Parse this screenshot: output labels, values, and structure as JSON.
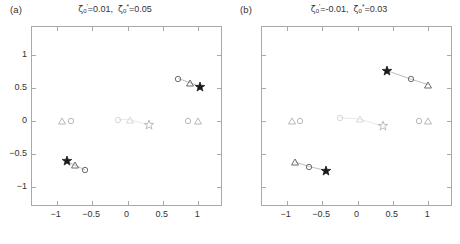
{
  "figure": {
    "background": "#ffffff",
    "axis_color": "#a9a9a9",
    "dark_marker_color": "#1a1a1a",
    "mid_marker_color": "#8a8a8a",
    "light_marker_color": "#cfcfcf",
    "faint_marker_color": "#e2e2e2"
  },
  "panels": [
    {
      "label": "(a)",
      "title_plain": "ζ'₀=0.01, ζ*₀=0.05",
      "title_parts": {
        "sym1": "ζ",
        "sub1": "0",
        "sup1": "'",
        "eq1": "=0.01,",
        "sym2": "ζ",
        "sub2": "0",
        "sup2": "*",
        "eq2": "=0.05"
      }
    },
    {
      "label": "(b)",
      "title_plain": "ζ'₀=-0.01, ζ*₀=0.03",
      "title_parts": {
        "sym1": "ζ",
        "sub1": "0",
        "sup1": "'",
        "eq1": "=-0.01,",
        "sym2": "ζ",
        "sub2": "0",
        "sup2": "*",
        "eq2": "=0.03"
      }
    }
  ],
  "axes": {
    "xlim": [
      -1.35,
      1.35
    ],
    "ylim": [
      -1.3,
      1.42
    ],
    "xticks": [
      -1,
      -0.5,
      0,
      0.5,
      1
    ],
    "xticklabels": [
      "−1",
      "−0.5",
      "0",
      "0.5",
      "1"
    ],
    "yticks": [
      1,
      0.5,
      0,
      -0.5,
      -1
    ],
    "yticklabels": [
      "1",
      "0.5",
      "0",
      "−0.5",
      "−1"
    ],
    "grid": false,
    "box": true
  },
  "chart_data": {
    "type": "scatter",
    "xlabel": "",
    "ylabel": "",
    "xlim": [
      -1.35,
      1.35
    ],
    "ylim": [
      -1.3,
      1.42
    ],
    "xticks": [
      -1,
      -0.5,
      0,
      0.5,
      1
    ],
    "yticks": [
      1,
      0.5,
      0,
      -0.5,
      -1
    ],
    "grid": false,
    "legend": "none",
    "marker_shapes": [
      "circle",
      "triangle",
      "star"
    ],
    "panels": [
      {
        "name": "(a)",
        "title": "ζ'₀=0.01, ζ*₀=0.05",
        "series": [
          {
            "name": "upper-right-branch",
            "shade": "dark",
            "connector": true,
            "points": [
              {
                "x": 0.72,
                "y": 0.64,
                "marker": "circle",
                "color": "#6d6d6d"
              },
              {
                "x": 0.88,
                "y": 0.58,
                "marker": "triangle",
                "color": "#6d6d6d"
              },
              {
                "x": 1.02,
                "y": 0.52,
                "marker": "star",
                "color": "#1a1a1a",
                "filled": true
              }
            ]
          },
          {
            "name": "lower-left-branch",
            "shade": "dark",
            "connector": true,
            "points": [
              {
                "x": -0.86,
                "y": -0.61,
                "marker": "star",
                "color": "#1a1a1a",
                "filled": true
              },
              {
                "x": -0.74,
                "y": -0.67,
                "marker": "triangle",
                "color": "#6d6d6d"
              },
              {
                "x": -0.6,
                "y": -0.74,
                "marker": "circle",
                "color": "#6d6d6d"
              }
            ]
          },
          {
            "name": "left-real-pair",
            "shade": "light",
            "connector": false,
            "points": [
              {
                "x": -0.92,
                "y": 0.0,
                "marker": "triangle",
                "color": "#b8b8b8"
              },
              {
                "x": -0.8,
                "y": 0.0,
                "marker": "circle",
                "color": "#b8b8b8"
              }
            ]
          },
          {
            "name": "right-real-pair",
            "shade": "light",
            "connector": false,
            "points": [
              {
                "x": 0.86,
                "y": 0.0,
                "marker": "circle",
                "color": "#b8b8b8"
              },
              {
                "x": 0.99,
                "y": 0.0,
                "marker": "triangle",
                "color": "#b8b8b8"
              }
            ]
          },
          {
            "name": "center-faint-branch",
            "shade": "faint",
            "connector": true,
            "points": [
              {
                "x": -0.13,
                "y": 0.02,
                "marker": "circle",
                "color": "#d8d8d8"
              },
              {
                "x": 0.03,
                "y": 0.02,
                "marker": "triangle",
                "color": "#d8d8d8"
              },
              {
                "x": 0.3,
                "y": -0.06,
                "marker": "star",
                "color": "#bdbdbd",
                "filled": false
              }
            ]
          }
        ]
      },
      {
        "name": "(b)",
        "title": "ζ'₀=-0.01, ζ*₀=0.03",
        "series": [
          {
            "name": "upper-right-branch",
            "shade": "dark",
            "connector": true,
            "points": [
              {
                "x": 0.42,
                "y": 0.76,
                "marker": "star",
                "color": "#1a1a1a",
                "filled": true
              },
              {
                "x": 0.76,
                "y": 0.63,
                "marker": "circle",
                "color": "#6d6d6d"
              },
              {
                "x": 1.0,
                "y": 0.55,
                "marker": "triangle",
                "color": "#6d6d6d"
              }
            ]
          },
          {
            "name": "lower-left-branch",
            "shade": "dark",
            "connector": true,
            "points": [
              {
                "x": -0.88,
                "y": -0.62,
                "marker": "triangle",
                "color": "#6d6d6d"
              },
              {
                "x": -0.68,
                "y": -0.69,
                "marker": "circle",
                "color": "#6d6d6d"
              },
              {
                "x": -0.44,
                "y": -0.75,
                "marker": "star",
                "color": "#1a1a1a",
                "filled": true
              }
            ]
          },
          {
            "name": "left-real-pair",
            "shade": "light",
            "connector": false,
            "points": [
              {
                "x": -0.93,
                "y": 0.0,
                "marker": "triangle",
                "color": "#b8b8b8"
              },
              {
                "x": -0.81,
                "y": 0.0,
                "marker": "circle",
                "color": "#b8b8b8"
              }
            ]
          },
          {
            "name": "right-real-pair",
            "shade": "light",
            "connector": false,
            "points": [
              {
                "x": 0.87,
                "y": 0.0,
                "marker": "circle",
                "color": "#b8b8b8"
              },
              {
                "x": 1.0,
                "y": 0.0,
                "marker": "triangle",
                "color": "#b8b8b8"
              }
            ]
          },
          {
            "name": "center-faint-branch",
            "shade": "faint",
            "connector": true,
            "points": [
              {
                "x": -0.25,
                "y": 0.05,
                "marker": "circle",
                "color": "#d8d8d8"
              },
              {
                "x": 0.03,
                "y": 0.03,
                "marker": "triangle",
                "color": "#d8d8d8"
              },
              {
                "x": 0.36,
                "y": -0.08,
                "marker": "star",
                "color": "#bdbdbd",
                "filled": false
              }
            ]
          }
        ]
      }
    ]
  }
}
